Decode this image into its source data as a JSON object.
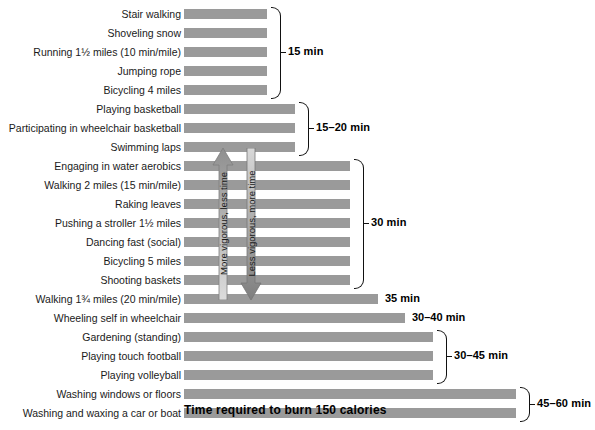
{
  "chart_data": {
    "type": "bar",
    "title": "Time required to burn 150 calories",
    "xlabel": "Time required to burn 150 calories",
    "ylabel": "",
    "orientation": "horizontal",
    "grid": false,
    "legend_position": "none",
    "xlim": [
      0,
      60
    ],
    "bar_color": "#9a9a9a",
    "categories": [
      "Stair walking",
      "Shoveling snow",
      "Running 1½ miles (10 min/mile)",
      "Jumping rope",
      "Bicycling 4 miles",
      "Playing basketball",
      "Participating in wheelchair basketball",
      "Swimming laps",
      "Engaging in water aerobics",
      "Walking 2 miles (15 min/mile)",
      "Raking leaves",
      "Pushing a stroller 1½ miles",
      "Dancing fast (social)",
      "Bicycling 5 miles",
      "Shooting baskets",
      "Walking 1¾ miles (20 min/mile)",
      "Wheeling self in wheelchair",
      "Gardening (standing)",
      "Playing touch football",
      "Playing volleyball",
      "Washing windows or floors",
      "Washing and waxing a car or boat"
    ],
    "values": [
      15,
      15,
      15,
      15,
      15,
      20,
      20,
      20,
      30,
      30,
      30,
      30,
      30,
      30,
      30,
      35,
      40,
      45,
      45,
      45,
      60,
      60
    ],
    "value_labels": [
      "15 min",
      "15 min",
      "15 min",
      "15 min",
      "15 min",
      "15–20 min",
      "15–20 min",
      "15–20 min",
      "30 min",
      "30 min",
      "30 min",
      "30 min",
      "30 min",
      "30 min",
      "30 min",
      "35 min",
      "30–40 min",
      "30–45 min",
      "30–45 min",
      "30–45 min",
      "45–60 min",
      "45–60 min"
    ]
  },
  "groups": [
    {
      "label": "15 min",
      "first": 0,
      "last": 4,
      "bracket": true
    },
    {
      "label": "15–20 min",
      "first": 5,
      "last": 7,
      "bracket": true
    },
    {
      "label": "30 min",
      "first": 8,
      "last": 14,
      "bracket": true
    },
    {
      "label": "35 min",
      "first": 15,
      "last": 15,
      "bracket": false
    },
    {
      "label": "30–40 min",
      "first": 16,
      "last": 16,
      "bracket": false
    },
    {
      "label": "30–45 min",
      "first": 17,
      "last": 19,
      "bracket": true
    },
    {
      "label": "45–60 min",
      "first": 20,
      "last": 21,
      "bracket": true
    }
  ],
  "annotations": {
    "up_arrow": {
      "text": "More vigorous, less time",
      "direction": "up",
      "color": "#b8b8b8"
    },
    "down_arrow": {
      "text": "Less vigorous, more time",
      "direction": "down",
      "color": "#8c8c8c"
    }
  },
  "footer": {
    "title": "Time required to burn 150 calories"
  }
}
